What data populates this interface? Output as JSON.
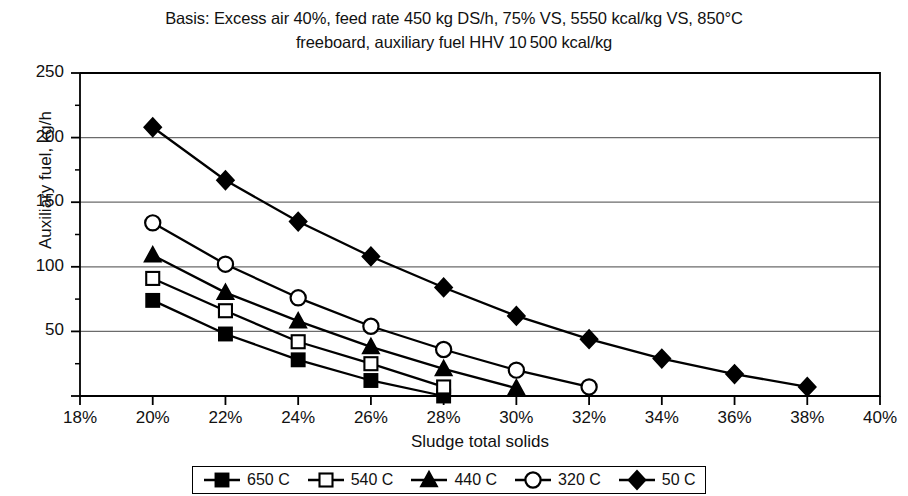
{
  "chart_data": {
    "type": "line",
    "title": "Basis: Excess air 40%, feed rate 450 kg DS/h, 75% VS, 5550 kcal/kg VS, 850°C freeboard, auxiliary fuel HHV 10 500 kcal/kg",
    "title_line1": "Basis: Excess air 40%, feed rate 450 kg DS/h, 75% VS, 5550 kcal/kg VS, 850°C",
    "title_line2": "freeboard, auxiliary fuel HHV 10 500 kcal/kg",
    "xlabel": "Sludge total solids",
    "ylabel": "Auxiliary fuel, kg/h",
    "xlim": [
      18,
      40
    ],
    "ylim": [
      0,
      250
    ],
    "xticks": [
      18,
      20,
      22,
      24,
      26,
      28,
      30,
      32,
      34,
      36,
      38,
      40
    ],
    "xtick_labels": [
      "18%",
      "20%",
      "22%",
      "24%",
      "26%",
      "28%",
      "30%",
      "32%",
      "34%",
      "36%",
      "38%",
      "40%"
    ],
    "yticks": [
      0,
      50,
      100,
      150,
      200,
      250
    ],
    "ytick_labels": [
      "",
      "50",
      "100",
      "150",
      "200",
      "250"
    ],
    "y_minor_ticks": [
      25,
      75,
      125,
      175,
      225
    ],
    "grid": "horizontal",
    "legend_position": "below-center",
    "series": [
      {
        "name": "650 C",
        "marker": "filled-square",
        "x": [
          20,
          22,
          24,
          26,
          28
        ],
        "values": [
          74,
          48,
          28,
          12,
          0
        ]
      },
      {
        "name": "540 C",
        "marker": "open-square",
        "x": [
          20,
          22,
          24,
          26,
          28
        ],
        "values": [
          91,
          66,
          42,
          25,
          7
        ]
      },
      {
        "name": "440 C",
        "marker": "filled-triangle",
        "x": [
          20,
          22,
          24,
          26,
          28,
          30
        ],
        "values": [
          109,
          80,
          58,
          38,
          21,
          6
        ]
      },
      {
        "name": "320 C",
        "marker": "open-circle",
        "x": [
          20,
          22,
          24,
          26,
          28,
          30,
          32
        ],
        "values": [
          134,
          102,
          76,
          54,
          36,
          20,
          7
        ]
      },
      {
        "name": "50 C",
        "marker": "filled-diamond",
        "x": [
          20,
          22,
          24,
          26,
          28,
          30,
          32,
          34,
          36,
          38
        ],
        "values": [
          208,
          167,
          135,
          108,
          84,
          62,
          44,
          29,
          17,
          7
        ]
      }
    ]
  },
  "legend": {
    "items": [
      {
        "label": "650 C",
        "marker": "filled-square"
      },
      {
        "label": "540 C",
        "marker": "open-square"
      },
      {
        "label": "440 C",
        "marker": "filled-triangle"
      },
      {
        "label": "320 C",
        "marker": "open-circle"
      },
      {
        "label": "50 C",
        "marker": "filled-diamond"
      }
    ]
  },
  "colors": {
    "line": "#000000",
    "grid": "#6b6b6b",
    "frame": "#000000",
    "background": "#ffffff"
  }
}
